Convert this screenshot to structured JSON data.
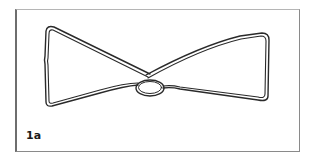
{
  "figure": {
    "label": "1a",
    "colors": {
      "stroke": "#2a2a2a",
      "frame": "#8a8a8a",
      "background": "#ffffff"
    }
  }
}
